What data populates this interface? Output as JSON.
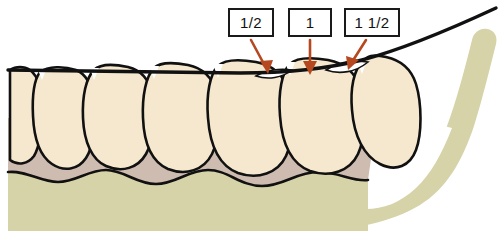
{
  "callouts": [
    {
      "id": "callout-half",
      "label": "1/2",
      "arrow_from": [
        251,
        40
      ],
      "arrow_to": [
        268,
        72
      ]
    },
    {
      "id": "callout-one",
      "label": "1",
      "arrow_from": [
        310,
        40
      ],
      "arrow_to": [
        310,
        73
      ]
    },
    {
      "id": "callout-onehalf",
      "label": "1 1/2",
      "arrow_from": [
        366,
        40
      ],
      "arrow_to": [
        349,
        71
      ]
    }
  ],
  "colors": {
    "tooth": "#F5E8CE",
    "tooth_outline": "#111111",
    "gingiva": "#CFBCB0",
    "bone": "#D6D3A8",
    "arrow": "#B5481F",
    "occlusal_line": "#111111",
    "box_border": "#1A1A1A",
    "background": "#FFFFFF"
  },
  "anatomy": {
    "occlusal_plane_label": "occlusal-plane-line",
    "teeth_count": 6,
    "layers": [
      "teeth",
      "gingiva",
      "alveolar-bone",
      "mandibular-ramus"
    ]
  }
}
